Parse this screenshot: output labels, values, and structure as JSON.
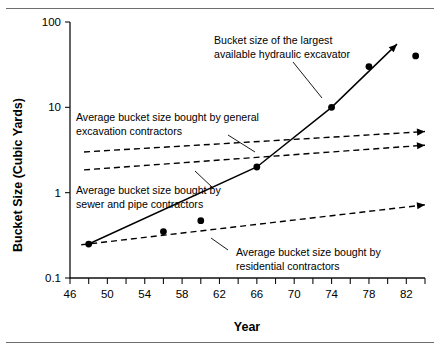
{
  "chart_data": {
    "type": "line",
    "title": "",
    "xlabel": "Year",
    "ylabel": "Bucket Size (Cubic Yards)",
    "yscale": "log",
    "ylim": [
      0.1,
      100
    ],
    "xlim": [
      46,
      84
    ],
    "grid": false,
    "legend_position": "none",
    "y_tick_labels": [
      "100",
      "10",
      "1",
      "0.1"
    ],
    "y_tick_values": [
      100,
      10,
      1,
      0.1
    ],
    "x_tick_labels": [
      "46",
      "50",
      "54",
      "58",
      "62",
      "66",
      "70",
      "74",
      "78",
      "82"
    ],
    "x_tick_values": [
      46,
      50,
      54,
      58,
      62,
      66,
      70,
      74,
      78,
      82
    ],
    "x_minor_tick_values": [
      48,
      52,
      56,
      60,
      64,
      68,
      72,
      76,
      80,
      84
    ],
    "series": [
      {
        "name": "Bucket size of the largest available hydraulic excavator",
        "style": "solid",
        "markers": true,
        "arrow": true,
        "x": [
          48,
          56,
          60,
          66,
          74,
          78,
          83
        ],
        "y": [
          0.25,
          0.35,
          0.47,
          2.0,
          10.0,
          30.0,
          40.0
        ],
        "line_x": [
          48,
          66,
          74,
          81
        ],
        "line_y": [
          0.25,
          2.0,
          10.0,
          55.0
        ]
      },
      {
        "name": "Average bucket size bought by general excavation contractors",
        "style": "dashed",
        "markers": false,
        "arrow": true,
        "x": [
          47.5,
          84
        ],
        "y": [
          3.0,
          5.2
        ]
      },
      {
        "name": "Average bucket size bought by sewer and pipe contractors",
        "style": "dashed",
        "markers": false,
        "arrow": true,
        "x": [
          47.5,
          84
        ],
        "y": [
          1.85,
          3.6
        ]
      },
      {
        "name": "Average bucket size bought by residential contractors",
        "style": "dashed",
        "markers": false,
        "arrow": true,
        "x": [
          47.2,
          84
        ],
        "y": [
          0.245,
          0.72
        ]
      }
    ],
    "annotations": [
      {
        "id": "largest-excavator",
        "lines": [
          "Bucket size of the largest",
          "available hydraulic excavator"
        ],
        "text_x": 214,
        "text_y": 44,
        "leader": [
          [
            293,
            62
          ],
          [
            322,
            98
          ]
        ]
      },
      {
        "id": "general-excavation",
        "lines": [
          "Average bucket size bought by general",
          "excavation contractors"
        ],
        "text_x": 76,
        "text_y": 121,
        "leader": [
          [
            228,
            135
          ],
          [
            255,
            152
          ]
        ]
      },
      {
        "id": "sewer-and-pipe",
        "lines": [
          "Average bucket size bought by",
          "sewer and pipe contractors"
        ],
        "text_x": 76,
        "text_y": 194,
        "leader": [
          [
            213,
            188
          ],
          [
            195,
            171
          ]
        ]
      },
      {
        "id": "residential",
        "lines": [
          "Average bucket size bought by",
          "residential contractors"
        ],
        "text_x": 236,
        "text_y": 256,
        "leader": [
          [
            228,
            250
          ],
          [
            211,
            238
          ]
        ]
      }
    ]
  },
  "colors": {
    "ink": "#000000",
    "rule": "#6e6e6e",
    "background": "#ffffff"
  }
}
